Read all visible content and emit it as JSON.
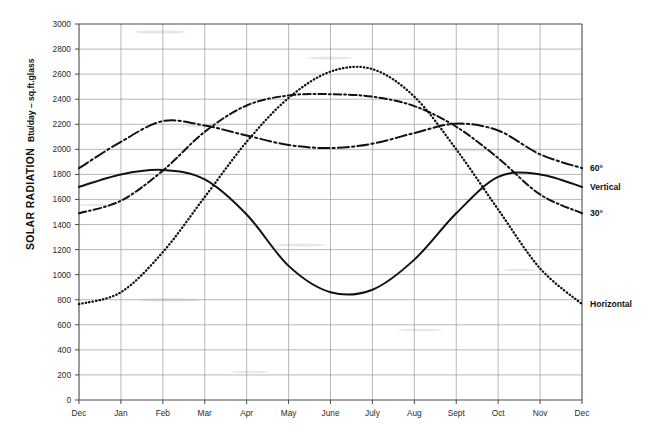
{
  "chart_data": {
    "type": "line",
    "title": "",
    "xlabel": "",
    "ylabel": "SOLAR RADIATION",
    "ylabel_units": "Btu/day – sq.ft.glass",
    "ylim": [
      0,
      3000
    ],
    "ytick_step": 200,
    "grid": true,
    "legend_position": "right-inline",
    "categories": [
      "Dec",
      "Jan",
      "Feb",
      "Mar",
      "Apr",
      "May",
      "June",
      "July",
      "Aug",
      "Sept",
      "Oct",
      "Nov",
      "Dec"
    ],
    "yticks": [
      "0",
      "200",
      "400",
      "600",
      "800",
      "1000",
      "1200",
      "1400",
      "1600",
      "1800",
      "2000",
      "2200",
      "2400",
      "2600",
      "2800",
      "3000"
    ],
    "series": [
      {
        "name": "60°",
        "style": "dash-dot",
        "values": [
          1850,
          2060,
          2225,
          2190,
          2110,
          2035,
          2010,
          2045,
          2130,
          2205,
          2150,
          1960,
          1850
        ]
      },
      {
        "name": "Vertical",
        "style": "solid",
        "values": [
          1700,
          1800,
          1835,
          1760,
          1480,
          1070,
          860,
          880,
          1120,
          1490,
          1780,
          1800,
          1700
        ]
      },
      {
        "name": "30°",
        "style": "dash-dot",
        "values": [
          1490,
          1590,
          1830,
          2140,
          2350,
          2430,
          2440,
          2420,
          2345,
          2180,
          1930,
          1640,
          1490
        ]
      },
      {
        "name": "Horizontal",
        "style": "dotted",
        "values": [
          765,
          860,
          1180,
          1620,
          2060,
          2410,
          2620,
          2640,
          2420,
          2000,
          1520,
          1050,
          765
        ]
      }
    ],
    "series_labels": [
      {
        "text": "60°",
        "y_value": 1850
      },
      {
        "text": "Vertical",
        "y_value": 1700
      },
      {
        "text": "30°",
        "y_value": 1490
      },
      {
        "text": "Horizontal",
        "y_value": 765
      }
    ]
  }
}
